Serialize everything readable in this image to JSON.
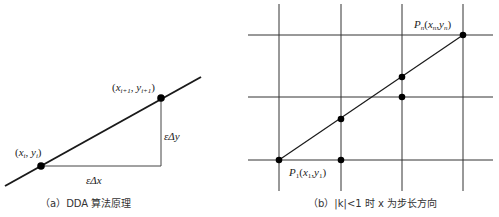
{
  "panel_a": {
    "caption": "（a）DDA 算法原理",
    "point_i": {
      "label_x": "x",
      "label_x_sub": "i",
      "label_y": "y",
      "label_y_sub": "i"
    },
    "point_i1": {
      "label_x": "x",
      "label_x_sub": "i+1",
      "label_y": "y",
      "label_y_sub": "i+1"
    },
    "dy_label": "εΔy",
    "dx_label": "εΔx"
  },
  "panel_b": {
    "caption": "（b）|k|<1 时 x 为步长方向",
    "start_label": {
      "p": "P",
      "p_sub": "1",
      "x": "x",
      "x_sub": "1",
      "y": "y",
      "y_sub": "1"
    },
    "end_label": {
      "p": "P",
      "p_sub": "n",
      "x": "x",
      "x_sub": "n",
      "y": "y",
      "y_sub": "n"
    }
  },
  "colors": {
    "line": "#1a1a1a",
    "grid": "#333333",
    "dot": "#000000"
  }
}
